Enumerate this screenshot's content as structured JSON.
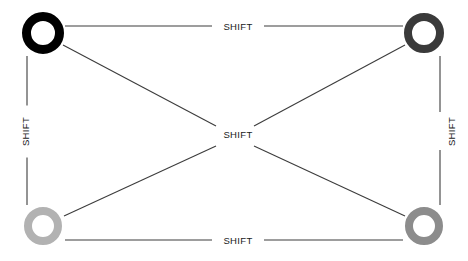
{
  "diagram": {
    "type": "state-transition-graph",
    "background_color": "#ffffff",
    "edge_color": "#3c3c3c",
    "label_color": "#1a1a1a",
    "nodes": [
      {
        "id": "top-left",
        "label": "",
        "shape": "ring",
        "color": "#000000",
        "cx": 43,
        "cy": 33,
        "radius": 21,
        "stroke_width": 9
      },
      {
        "id": "top-right",
        "label": "",
        "shape": "ring",
        "color": "#3a3a3a",
        "cx": 424,
        "cy": 33,
        "radius": 20,
        "stroke_width": 8
      },
      {
        "id": "bottom-left",
        "label": "",
        "shape": "ring",
        "color": "#b2b2b2",
        "cx": 43,
        "cy": 226,
        "radius": 19,
        "stroke_width": 8
      },
      {
        "id": "bottom-right",
        "label": "",
        "shape": "ring",
        "color": "#8c8c8c",
        "cx": 424,
        "cy": 226,
        "radius": 19,
        "stroke_width": 8
      }
    ],
    "edges": [
      {
        "id": "edge-top",
        "from": "top-left",
        "to": "top-right",
        "label": "SHIFT",
        "orientation": "horizontal",
        "label_x": 234,
        "label_y": 19
      },
      {
        "id": "edge-left",
        "from": "top-left",
        "to": "bottom-left",
        "label": "SHIFT",
        "orientation": "vertical",
        "label_x": 20,
        "label_y": 130
      },
      {
        "id": "edge-right",
        "from": "top-right",
        "to": "bottom-right",
        "label": "SHIFT",
        "orientation": "vertical",
        "label_x": 447,
        "label_y": 130
      },
      {
        "id": "edge-bottom",
        "from": "bottom-left",
        "to": "bottom-right",
        "label": "SHIFT",
        "orientation": "horizontal",
        "label_x": 234,
        "label_y": 241
      },
      {
        "id": "edge-diagonal-center",
        "from": "center-crossing",
        "to": "center-crossing",
        "label": "SHIFT",
        "orientation": "horizontal",
        "label_x": 234,
        "label_y": 133
      }
    ]
  }
}
